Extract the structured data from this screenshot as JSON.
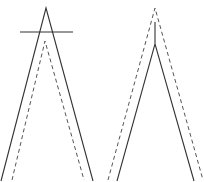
{
  "diagram": {
    "background": "#ffffff",
    "stroke_color": "#333333",
    "dash_color": "#555555",
    "figures": [
      {
        "name": "left-figure",
        "solid_apex": [
          46,
          8
        ],
        "solid_left_end": [
          1,
          181
        ],
        "solid_right_end": [
          93,
          181
        ],
        "crossbar": {
          "x1": 20,
          "y": 32,
          "x2": 73
        },
        "dashed_apex": [
          45,
          41
        ],
        "dashed_left_end": [
          12,
          180
        ],
        "dashed_right_end": [
          84,
          180
        ]
      },
      {
        "name": "right-figure",
        "dashed_apex": [
          155,
          8
        ],
        "dashed_left_end": [
          108,
          180
        ],
        "dashed_right_end": [
          203,
          180
        ],
        "solid_stem_top": [
          155,
          22
        ],
        "solid_stem_bottom": [
          155,
          44
        ],
        "solid_left_end": [
          117,
          181
        ],
        "solid_right_end": [
          194,
          181
        ]
      }
    ]
  }
}
